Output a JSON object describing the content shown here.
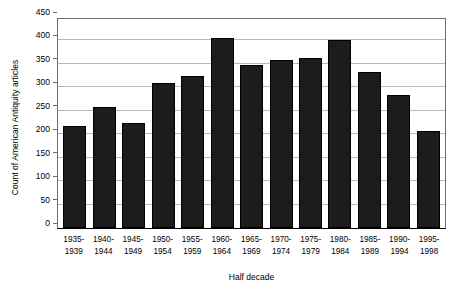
{
  "chart_data": {
    "type": "bar",
    "title": "",
    "xlabel": "Half decade",
    "ylabel": "Count of American Antiquity articles",
    "categories": [
      "1935-1939",
      "1940-1944",
      "1945-1949",
      "1950-1954",
      "1955-1959",
      "1960-1964",
      "1965-1969",
      "1970-1974",
      "1975-1979",
      "1980-1984",
      "1985-1989",
      "1990-1994",
      "1995-1998"
    ],
    "category_lines": [
      [
        "1935-",
        "1939"
      ],
      [
        "1940-",
        "1944"
      ],
      [
        "1945-",
        "1949"
      ],
      [
        "1950-",
        "1954"
      ],
      [
        "1955-",
        "1959"
      ],
      [
        "1960-",
        "1964"
      ],
      [
        "1965-",
        "1969"
      ],
      [
        "1970-",
        "1974"
      ],
      [
        "1975-",
        "1979"
      ],
      [
        "1980-",
        "1984"
      ],
      [
        "1985-",
        "1989"
      ],
      [
        "1990-",
        "1994"
      ],
      [
        "1995-",
        "1998"
      ]
    ],
    "values": [
      218,
      258,
      225,
      310,
      325,
      405,
      348,
      358,
      363,
      402,
      333,
      284,
      207
    ],
    "ylim": [
      0,
      450
    ],
    "ytick_values": [
      0,
      50,
      100,
      150,
      200,
      250,
      300,
      350,
      400,
      450
    ],
    "ytick_labels": [
      "0",
      "50",
      "100",
      "150",
      "200",
      "250",
      "300",
      "350",
      "400",
      "450"
    ],
    "grid": "horizontal",
    "legend": "none",
    "bar_color": "#1c1c1c",
    "grid_color": "#b9b9b9",
    "axis_color": "#6e6e6e"
  }
}
